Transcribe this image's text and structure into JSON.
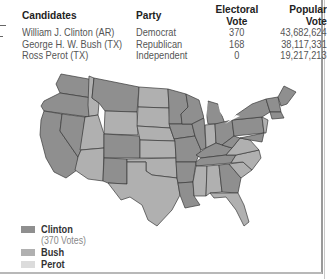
{
  "table": {
    "headers": [
      "Candidates",
      "Party",
      "Electoral Vote",
      "Popular Vote"
    ],
    "rows": [
      {
        "candidate": "William J. Clinton (AR)",
        "party": "Democrat",
        "electoral": "370",
        "popular": "43,682,624"
      },
      {
        "candidate": "George H. W. Bush (TX)",
        "party": "Republican",
        "electoral": "168",
        "popular": "38,117,331"
      },
      {
        "candidate": "Ross Perot (TX)",
        "party": "Independent",
        "electoral": "0",
        "popular": "19,217,213"
      }
    ]
  },
  "legend": {
    "items": [
      {
        "label": "Clinton",
        "sublabel": "(370 Votes)",
        "color": "#8f8f8f"
      },
      {
        "label": "Bush",
        "color": "#b0b0b0"
      },
      {
        "label": "Perot",
        "color": "#dcdcdc"
      }
    ]
  },
  "colors": {
    "clinton": "#8f8f8f",
    "bush": "#b0b0b0",
    "border": "#3a3a3a"
  }
}
